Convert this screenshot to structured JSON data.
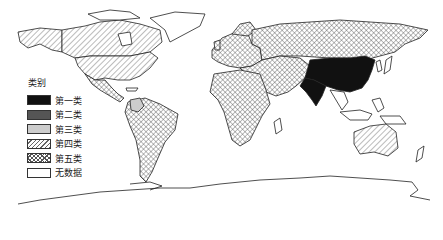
{
  "map": {
    "type": "world choropleth",
    "legend": {
      "title": "类别",
      "items": [
        {
          "label": "第一类",
          "pattern": "solid-black",
          "color": "#111111"
        },
        {
          "label": "第二类",
          "pattern": "solid-dark-gray",
          "color": "#555555"
        },
        {
          "label": "第三类",
          "pattern": "solid-light-gray",
          "color": "#cccccc"
        },
        {
          "label": "第四类",
          "pattern": "diagonal-hatch",
          "color": "#ffffff"
        },
        {
          "label": "第五类",
          "pattern": "crosshatch",
          "color": "#ffffff"
        },
        {
          "label": "无数据",
          "pattern": "none",
          "color": "#ffffff"
        }
      ]
    },
    "regions": [
      {
        "name": "China",
        "category": "第一类"
      },
      {
        "name": "India",
        "category": "第一类"
      },
      {
        "name": "Colombia",
        "category": "第三类"
      },
      {
        "name": "USA",
        "category": "第四类"
      },
      {
        "name": "Canada",
        "category": "第四类"
      },
      {
        "name": "Alaska",
        "category": "第四类"
      },
      {
        "name": "Australia",
        "category": "第四类"
      },
      {
        "name": "Russia",
        "category": "第五类"
      },
      {
        "name": "Europe",
        "category": "第五类"
      },
      {
        "name": "Africa",
        "category": "第五类"
      },
      {
        "name": "South America",
        "category": "第五类"
      },
      {
        "name": "Central Asia & Middle East",
        "category": "第五类"
      },
      {
        "name": "Mexico & Central America",
        "category": "第五类"
      },
      {
        "name": "Greenland",
        "category": "无数据"
      },
      {
        "name": "Antarctica",
        "category": "无数据"
      },
      {
        "name": "Southeast Asia",
        "category": "无数据"
      }
    ]
  }
}
